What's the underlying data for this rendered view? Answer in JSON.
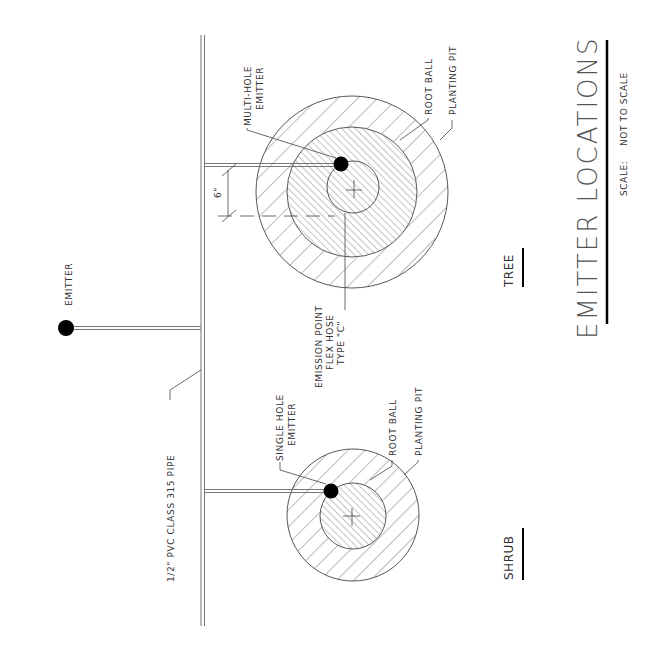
{
  "drawing": {
    "title": "EMITTER LOCATIONS",
    "scale_label": "SCALE:",
    "scale_value": "NOT TO SCALE",
    "colors": {
      "ink": "#333333",
      "pipe": "#777777",
      "emitter": "#000000",
      "background": "#ffffff"
    }
  },
  "pipe": {
    "label": "1/2\" PVC CLASS 315 PIPE"
  },
  "standalone_emitter": {
    "label": "EMITTER"
  },
  "tree": {
    "heading": "TREE",
    "emitter_label_line1": "MULTI-HOLE",
    "emitter_label_line2": "EMITTER",
    "root_ball_label": "ROOT BALL",
    "planting_pit_label": "PLANTING PIT",
    "emission_line1": "EMISSION POINT",
    "emission_line2": "FLEX HOSE",
    "emission_line3": "TYPE \"C\"",
    "dimension": "6\""
  },
  "shrub": {
    "heading": "SHRUB",
    "emitter_label_line1": "SINGLE HOLE",
    "emitter_label_line2": "EMITTER",
    "root_ball_label": "ROOT BALL",
    "planting_pit_label": "PLANTING PIT"
  }
}
